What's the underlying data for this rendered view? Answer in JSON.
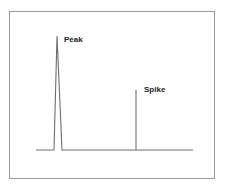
{
  "chart_data": {
    "type": "line",
    "title": "",
    "xlabel": "",
    "ylabel": "",
    "grid": false,
    "legend": null,
    "annotations": [
      {
        "text": "Peak",
        "target": "peak"
      },
      {
        "text": "Spike",
        "target": "spike"
      }
    ],
    "series": [
      {
        "name": "signal",
        "color": "#6e6e6e",
        "points_px": [
          [
            36,
            150
          ],
          [
            54,
            150
          ],
          [
            57,
            36
          ],
          [
            62,
            150
          ],
          [
            136,
            150
          ],
          [
            136,
            90
          ],
          [
            136,
            150
          ],
          [
            193,
            150
          ]
        ]
      }
    ],
    "relative_heights": {
      "baseline": 0,
      "peak": 1.0,
      "spike": 0.53
    }
  },
  "labels": {
    "peak": "Peak",
    "spike": "Spike"
  },
  "colors": {
    "frame": "#9a9a9a",
    "signal": "#6e6e6e",
    "text": "#222222",
    "background": "#ffffff"
  }
}
